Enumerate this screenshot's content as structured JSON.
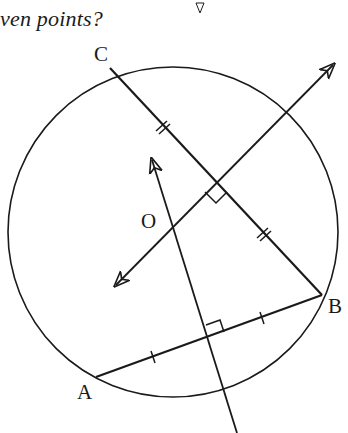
{
  "caption": {
    "text": "ven points?"
  },
  "labels": {
    "C": {
      "text": "C",
      "x": 94,
      "y": 44
    },
    "O": {
      "text": "O",
      "x": 141,
      "y": 211
    },
    "B": {
      "text": "B",
      "x": 328,
      "y": 296
    },
    "A": {
      "text": "A",
      "x": 77,
      "y": 382
    }
  },
  "geometry": {
    "points": {
      "A": [
        96,
        377
      ],
      "B": [
        322,
        295
      ],
      "C": [
        110,
        68
      ],
      "O": [
        172,
        226
      ]
    },
    "circle": {
      "cx": 173,
      "cy": 232,
      "r": 165
    },
    "perp_bisector_CB": {
      "from": [
        116,
        285
      ],
      "to": [
        333,
        65
      ],
      "midpoint": [
        216,
        181
      ],
      "right_angle_mark": true
    },
    "perp_bisector_AB": {
      "from": [
        152,
        160
      ],
      "to": [
        237,
        433
      ],
      "midpoint": [
        209,
        336
      ],
      "right_angle_mark": true
    },
    "equal_marks": {
      "CB": "double-tick",
      "AB": "single-tick"
    },
    "colors": {
      "ink": "#1a1a1a",
      "background": "#ffffff"
    }
  }
}
